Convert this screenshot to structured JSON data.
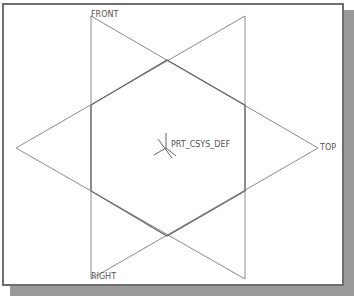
{
  "datum_planes": {
    "front": {
      "label": "FRONT"
    },
    "right": {
      "label": "RIGHT"
    },
    "top": {
      "label": "TOP"
    }
  },
  "coordinate_system": {
    "label": "PRT_CSYS_DEF",
    "axes": [
      "X",
      "Y",
      "Z"
    ]
  },
  "colors": {
    "line": "#8c8c8c",
    "overlap_line": "#555555",
    "label": "#555555",
    "border": "#6e6e6e",
    "shadow": "#9a9a9a"
  }
}
